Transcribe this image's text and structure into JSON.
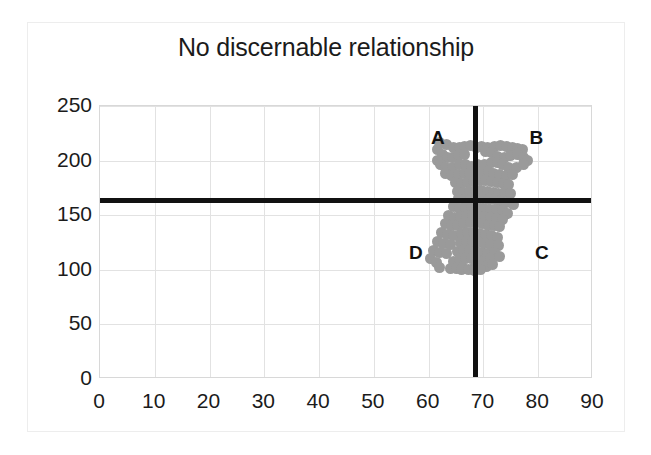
{
  "chart_data": {
    "type": "scatter",
    "title": "No discernable relationship",
    "xlabel": "",
    "ylabel": "",
    "xlim": [
      0,
      90
    ],
    "ylim": [
      0,
      250
    ],
    "xticks": [
      0,
      10,
      20,
      30,
      40,
      50,
      60,
      70,
      80,
      90
    ],
    "yticks": [
      0,
      50,
      100,
      150,
      200,
      250
    ],
    "grid": true,
    "legend": "none",
    "marker_color": "#9a9a9a",
    "marker_size": 11,
    "reference_lines": [
      {
        "name": "horizontal-median-line",
        "orientation": "horizontal",
        "value": 164,
        "color": "#111111"
      },
      {
        "name": "vertical-median-line",
        "orientation": "vertical",
        "value": 68.5,
        "color": "#111111"
      }
    ],
    "quadrant_labels": [
      {
        "label": "A",
        "x": 61.5,
        "y": 221,
        "quadrant": "upper-left"
      },
      {
        "label": "B",
        "x": 79.5,
        "y": 221,
        "quadrant": "upper-right"
      },
      {
        "label": "C",
        "x": 80.5,
        "y": 115,
        "quadrant": "lower-right"
      },
      {
        "label": "D",
        "x": 57.5,
        "y": 115,
        "quadrant": "lower-left"
      }
    ],
    "points": [
      [
        62.0,
        217
      ],
      [
        63.2,
        215
      ],
      [
        64.5,
        212
      ],
      [
        65.6,
        212
      ],
      [
        66.6,
        213
      ],
      [
        67.6,
        214
      ],
      [
        68.7,
        212
      ],
      [
        69.7,
        213
      ],
      [
        70.8,
        212
      ],
      [
        72.0,
        213
      ],
      [
        73.1,
        214
      ],
      [
        74.2,
        213
      ],
      [
        75.3,
        212
      ],
      [
        76.3,
        211
      ],
      [
        77.1,
        210
      ],
      [
        61.7,
        210
      ],
      [
        62.6,
        206
      ],
      [
        63.4,
        203
      ],
      [
        64.4,
        203
      ],
      [
        65.5,
        205
      ],
      [
        66.6,
        206
      ],
      [
        70.3,
        208
      ],
      [
        71.5,
        207
      ],
      [
        72.6,
        204
      ],
      [
        73.8,
        203
      ],
      [
        75.0,
        205
      ],
      [
        76.2,
        206
      ],
      [
        77.3,
        203
      ],
      [
        78.0,
        200
      ],
      [
        61.6,
        200
      ],
      [
        62.2,
        196
      ],
      [
        63.1,
        194
      ],
      [
        64.3,
        194
      ],
      [
        65.6,
        196
      ],
      [
        66.8,
        196
      ],
      [
        67.8,
        195
      ],
      [
        69.0,
        196
      ],
      [
        70.2,
        196
      ],
      [
        71.4,
        198
      ],
      [
        72.5,
        198
      ],
      [
        73.4,
        196
      ],
      [
        74.5,
        194
      ],
      [
        76.0,
        194
      ],
      [
        77.4,
        196
      ],
      [
        63.0,
        188
      ],
      [
        64.2,
        186
      ],
      [
        65.4,
        187
      ],
      [
        66.5,
        188
      ],
      [
        67.5,
        188
      ],
      [
        68.6,
        189
      ],
      [
        69.8,
        190
      ],
      [
        70.9,
        190
      ],
      [
        71.9,
        188
      ],
      [
        73.0,
        187
      ],
      [
        74.2,
        186
      ],
      [
        75.3,
        187
      ],
      [
        64.9,
        180
      ],
      [
        66.0,
        179
      ],
      [
        67.1,
        180
      ],
      [
        68.2,
        181
      ],
      [
        69.3,
        182
      ],
      [
        70.4,
        182
      ],
      [
        71.5,
        181
      ],
      [
        72.6,
        180
      ],
      [
        73.7,
        179
      ],
      [
        74.6,
        178
      ],
      [
        65.3,
        172
      ],
      [
        66.4,
        171
      ],
      [
        67.5,
        172
      ],
      [
        68.5,
        173
      ],
      [
        69.6,
        173
      ],
      [
        70.7,
        172
      ],
      [
        71.8,
        171
      ],
      [
        72.8,
        170
      ],
      [
        73.9,
        171
      ],
      [
        74.9,
        170
      ],
      [
        65.5,
        165
      ],
      [
        66.6,
        164
      ],
      [
        67.7,
        164
      ],
      [
        68.8,
        165
      ],
      [
        69.9,
        165
      ],
      [
        71.0,
        164
      ],
      [
        72.1,
        164
      ],
      [
        73.2,
        163
      ],
      [
        74.3,
        162
      ],
      [
        75.4,
        160
      ],
      [
        64.6,
        158
      ],
      [
        65.7,
        156
      ],
      [
        66.8,
        156
      ],
      [
        67.9,
        157
      ],
      [
        69.0,
        157
      ],
      [
        70.1,
        156
      ],
      [
        71.2,
        155
      ],
      [
        72.3,
        155
      ],
      [
        73.4,
        154
      ],
      [
        74.4,
        152
      ],
      [
        63.6,
        150
      ],
      [
        64.7,
        148
      ],
      [
        65.8,
        148
      ],
      [
        66.9,
        149
      ],
      [
        68.0,
        150
      ],
      [
        69.1,
        150
      ],
      [
        70.2,
        149
      ],
      [
        71.3,
        148
      ],
      [
        72.4,
        147
      ],
      [
        73.4,
        146
      ],
      [
        63.1,
        142
      ],
      [
        64.2,
        141
      ],
      [
        65.3,
        141
      ],
      [
        66.4,
        142
      ],
      [
        67.6,
        143
      ],
      [
        68.7,
        143
      ],
      [
        69.8,
        142
      ],
      [
        70.9,
        141
      ],
      [
        72.0,
        141
      ],
      [
        73.0,
        140
      ],
      [
        62.4,
        134
      ],
      [
        63.5,
        132
      ],
      [
        64.6,
        131
      ],
      [
        66.0,
        133
      ],
      [
        67.1,
        134
      ],
      [
        68.2,
        134
      ],
      [
        69.3,
        133
      ],
      [
        70.4,
        132
      ],
      [
        71.5,
        131
      ],
      [
        72.6,
        130
      ],
      [
        61.6,
        126
      ],
      [
        62.7,
        124
      ],
      [
        63.9,
        123
      ],
      [
        65.8,
        125
      ],
      [
        66.9,
        126
      ],
      [
        68.0,
        126
      ],
      [
        69.1,
        125
      ],
      [
        70.2,
        124
      ],
      [
        71.3,
        123
      ],
      [
        72.8,
        122
      ],
      [
        60.8,
        118
      ],
      [
        61.9,
        116
      ],
      [
        63.2,
        115
      ],
      [
        65.2,
        117
      ],
      [
        66.3,
        118
      ],
      [
        67.4,
        118
      ],
      [
        68.5,
        117
      ],
      [
        69.6,
        116
      ],
      [
        70.7,
        115
      ],
      [
        72.1,
        116
      ],
      [
        60.4,
        110
      ],
      [
        61.4,
        107
      ],
      [
        64.6,
        108
      ],
      [
        65.7,
        109
      ],
      [
        66.8,
        110
      ],
      [
        67.9,
        110
      ],
      [
        69.0,
        109
      ],
      [
        70.1,
        108
      ],
      [
        71.2,
        110
      ],
      [
        73.0,
        112
      ],
      [
        62.0,
        102
      ],
      [
        64.0,
        101
      ],
      [
        65.1,
        101
      ],
      [
        66.2,
        102
      ],
      [
        68.3,
        102
      ],
      [
        69.4,
        101
      ],
      [
        70.5,
        103
      ],
      [
        71.6,
        105
      ],
      [
        66.0,
        100
      ],
      [
        67.2,
        100
      ],
      [
        68.4,
        99
      ],
      [
        69.5,
        100
      ]
    ]
  }
}
